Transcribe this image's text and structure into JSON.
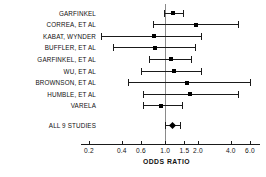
{
  "chart_data": {
    "type": "scatter",
    "title": "",
    "xlabel": "ODDS RATIO",
    "ylabel": "",
    "xscale": "log",
    "xlim": [
      0.2,
      6.0
    ],
    "grid": false,
    "legend": null,
    "null_reference": 1.0,
    "tick_labels": [
      "0.2",
      "0.4",
      "0.6",
      "1.0",
      "1.5",
      "2.0",
      "4.0",
      "6.0"
    ],
    "tick_values": [
      0.2,
      0.4,
      0.6,
      1.0,
      1.5,
      2.0,
      4.0,
      6.0
    ],
    "categories": [
      "GARFINKEL",
      "CORREA, ET AL",
      "KABAT, WYNDER",
      "BUFFLER, ET AL",
      "GARFINKEL, ET AL",
      "WU, ET AL",
      "BROWNSON, ET AL",
      "HUMBLE, ET AL",
      "VARELA",
      "ALL 9 STUDIES"
    ],
    "points": [
      {
        "label": "GARFINKEL",
        "estimate": 1.17,
        "ci_low": 0.97,
        "ci_high": 1.45,
        "summary": false
      },
      {
        "label": "CORREA, ET AL",
        "estimate": 1.9,
        "ci_low": 0.77,
        "ci_high": 4.7,
        "summary": false
      },
      {
        "label": "KABAT, WYNDER",
        "estimate": 0.79,
        "ci_low": 0.26,
        "ci_high": 2.12,
        "summary": false
      },
      {
        "label": "BUFFLER, ET AL",
        "estimate": 0.8,
        "ci_low": 0.33,
        "ci_high": 1.87,
        "summary": false
      },
      {
        "label": "GARFINKEL, ET AL",
        "estimate": 1.13,
        "ci_low": 0.71,
        "ci_high": 1.72,
        "summary": false
      },
      {
        "label": "WU, ET AL",
        "estimate": 1.21,
        "ci_low": 0.6,
        "ci_high": 2.12,
        "summary": false
      },
      {
        "label": "BROWNSON, ET AL",
        "estimate": 1.6,
        "ci_low": 0.46,
        "ci_high": 6.0,
        "summary": false
      },
      {
        "label": "HUMBLE, ET AL",
        "estimate": 1.7,
        "ci_low": 0.63,
        "ci_high": 4.7,
        "summary": false
      },
      {
        "label": "VARELA",
        "estimate": 0.91,
        "ci_low": 0.63,
        "ci_high": 1.43,
        "summary": false
      },
      {
        "label": "ALL 9 STUDIES",
        "estimate": 1.17,
        "ci_low": 1.0,
        "ci_high": 1.37,
        "summary": true
      }
    ]
  }
}
